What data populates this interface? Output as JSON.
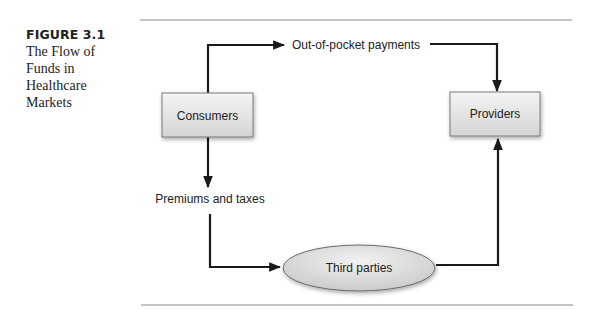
{
  "figure": {
    "number": "FIGURE 3.1",
    "title_lines": [
      "The Flow of",
      "Funds in",
      "Healthcare",
      "Markets"
    ]
  },
  "diagram": {
    "nodes": {
      "consumers": {
        "label": "Consumers",
        "shape": "rectangle"
      },
      "providers": {
        "label": "Providers",
        "shape": "rectangle"
      },
      "third_parties": {
        "label": "Third parties",
        "shape": "ellipse"
      }
    },
    "edges": [
      {
        "from": "Consumers",
        "to": "Providers",
        "label": "Out-of-pocket payments"
      },
      {
        "from": "Consumers",
        "to": "Third parties",
        "label": "Premiums and taxes"
      },
      {
        "from": "Third parties",
        "to": "Providers",
        "label": ""
      }
    ],
    "colors": {
      "node_fill_top": "#f2f2f2",
      "node_fill_bottom": "#d6d6d6",
      "node_border": "#7a7a7a",
      "arrow": "#1a1a1a",
      "rule": "#8a8a8a"
    }
  }
}
